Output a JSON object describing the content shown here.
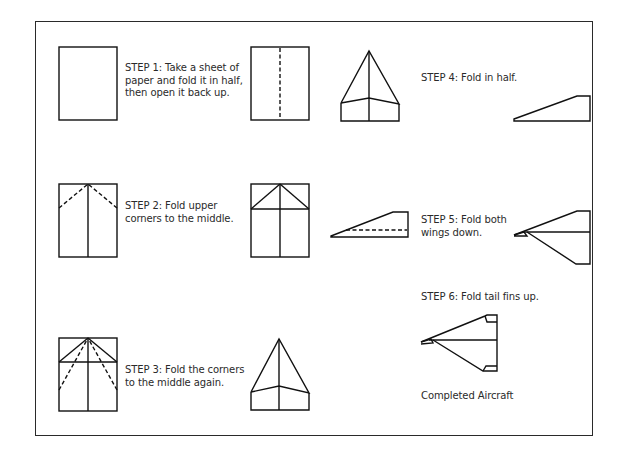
{
  "diagram": {
    "steps": [
      {
        "id": "step-1",
        "lines": [
          "STEP 1: Take a sheet of",
          "paper and fold it in half,",
          "then open it back up."
        ]
      },
      {
        "id": "step-2",
        "lines": [
          "STEP 2: Fold upper",
          "corners to the middle."
        ]
      },
      {
        "id": "step-3",
        "lines": [
          "STEP 3: Fold the corners",
          "to the middle again."
        ]
      },
      {
        "id": "step-4",
        "lines": [
          "STEP 4: Fold in half."
        ]
      },
      {
        "id": "step-5",
        "lines": [
          "STEP 5: Fold both",
          "wings down."
        ]
      },
      {
        "id": "step-6",
        "lines": [
          "STEP 6: Fold tail fins up."
        ]
      }
    ],
    "completed_label": "Completed Aircraft",
    "colors": {
      "line": "#111111",
      "text": "#2a2a2a",
      "frame": "#2a2a2a",
      "background": "#ffffff"
    }
  }
}
